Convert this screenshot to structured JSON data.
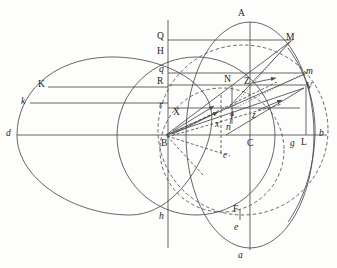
{
  "figure": {
    "name": "geometric-optics-construction-diagram",
    "background_color": "#fdfdfc",
    "stroke_color": "#4a4a4a",
    "label_color": "#1b1b1b"
  },
  "labels": [
    {
      "id": "A",
      "text": "A",
      "x": 238,
      "y": 9,
      "style": "roman"
    },
    {
      "id": "Q",
      "text": "Q",
      "x": 157,
      "y": 32,
      "style": "roman"
    },
    {
      "id": "M",
      "text": "M",
      "x": 286,
      "y": 33,
      "style": "roman"
    },
    {
      "id": "H",
      "text": "H",
      "x": 157,
      "y": 47,
      "style": "roman"
    },
    {
      "id": "q",
      "text": "q",
      "x": 159,
      "y": 65,
      "style": "italic"
    },
    {
      "id": "m",
      "text": "m",
      "x": 306,
      "y": 67,
      "style": "italic"
    },
    {
      "id": "R",
      "text": "R",
      "x": 157,
      "y": 77,
      "style": "roman"
    },
    {
      "id": "K",
      "text": "K",
      "x": 38,
      "y": 80,
      "style": "roman"
    },
    {
      "id": "N",
      "text": "N",
      "x": 224,
      "y": 75,
      "style": "roman"
    },
    {
      "id": "Z",
      "text": "Z",
      "x": 244,
      "y": 77,
      "style": "roman"
    },
    {
      "id": "V",
      "text": "V",
      "x": 306,
      "y": 82,
      "style": "roman"
    },
    {
      "id": "k",
      "text": "k",
      "x": 21,
      "y": 97,
      "style": "italic"
    },
    {
      "id": "r",
      "text": "r",
      "x": 159,
      "y": 101,
      "style": "italic"
    },
    {
      "id": "X",
      "text": "X",
      "x": 173,
      "y": 108,
      "style": "roman"
    },
    {
      "id": "z",
      "text": "z",
      "x": 252,
      "y": 111,
      "style": "italic"
    },
    {
      "id": "x",
      "text": "x",
      "x": 215,
      "y": 120,
      "style": "italic"
    },
    {
      "id": "n",
      "text": "n",
      "x": 226,
      "y": 123,
      "style": "italic"
    },
    {
      "id": "d",
      "text": "d",
      "x": 6,
      "y": 129,
      "style": "italic"
    },
    {
      "id": "b",
      "text": "b",
      "x": 319,
      "y": 129,
      "style": "italic"
    },
    {
      "id": "B",
      "text": "B",
      "x": 161,
      "y": 139,
      "style": "roman"
    },
    {
      "id": "C",
      "text": "C",
      "x": 247,
      "y": 139,
      "style": "roman"
    },
    {
      "id": "g",
      "text": "g",
      "x": 290,
      "y": 139,
      "style": "italic"
    },
    {
      "id": "L",
      "text": "L",
      "x": 301,
      "y": 138,
      "style": "roman"
    },
    {
      "id": "c",
      "text": "c",
      "x": 223,
      "y": 151,
      "style": "italic"
    },
    {
      "id": "F",
      "text": "F",
      "x": 233,
      "y": 205,
      "style": "roman"
    },
    {
      "id": "h",
      "text": "h",
      "x": 159,
      "y": 212,
      "style": "italic"
    },
    {
      "id": "e",
      "text": "e",
      "x": 234,
      "y": 223,
      "style": "italic"
    },
    {
      "id": "a",
      "text": "a",
      "x": 238,
      "y": 251,
      "style": "italic"
    }
  ],
  "points": {
    "A": [
      250,
      22
    ],
    "a": [
      250,
      248
    ],
    "B": [
      166,
      135
    ],
    "C": [
      250,
      135
    ],
    "d": [
      17,
      135
    ],
    "b": [
      327,
      135
    ],
    "Q": [
      168,
      40
    ],
    "M": [
      290,
      40
    ],
    "H": [
      168,
      56
    ],
    "q": [
      168,
      73
    ],
    "m": [
      304,
      73
    ],
    "R": [
      168,
      85
    ],
    "N": [
      232,
      85
    ],
    "k": [
      30,
      103
    ],
    "r": [
      168,
      108
    ],
    "V": [
      304,
      90
    ],
    "L": [
      306,
      135
    ],
    "g": [
      296,
      135
    ],
    "K": [
      48,
      87
    ],
    "h": [
      168,
      215
    ],
    "F": [
      240,
      212
    ],
    "e": [
      240,
      227
    ],
    "c": [
      232,
      158
    ],
    "n": [
      232,
      123
    ],
    "x": [
      222,
      128
    ],
    "X": [
      186,
      113
    ],
    "Z": [
      256,
      83
    ],
    "z": [
      260,
      115
    ]
  },
  "geometry_notes": {
    "outer_left_ellipse": "d - K - h oval, leftmost at d",
    "outer_right_ellipse": "A - b - a - large oval centred near C",
    "solid_circle": "circle centred at B through N and h",
    "dashed_circle_large": "dashed circle centred near C",
    "dashed_circle_small": "dashed circle through F, e, c",
    "horizontal_chords": [
      "Q-M",
      "q-m",
      "R-N",
      "k-r line",
      "d-b axis"
    ],
    "arrows": [
      "B to N region",
      "B to m region",
      "Z short arrow",
      "z short arrow",
      "n upward arrow"
    ]
  }
}
